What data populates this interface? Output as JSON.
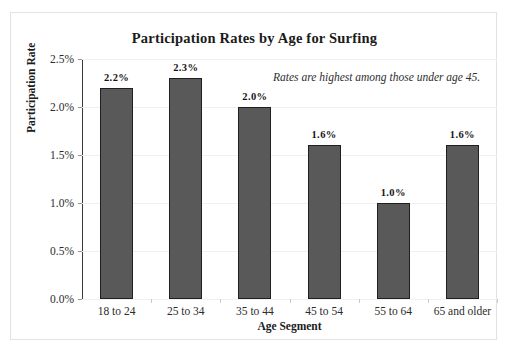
{
  "chart_data": {
    "type": "bar",
    "title": "Participation Rates by Age for Surfing",
    "xlabel": "Age Segment",
    "ylabel": "Participation Rate",
    "categories": [
      "18 to 24",
      "25 to 34",
      "35 to 44",
      "45 to 54",
      "55 to 64",
      "65 and older"
    ],
    "values": [
      2.2,
      2.3,
      2.0,
      1.6,
      1.0,
      1.6
    ],
    "data_labels": [
      "2.2%",
      "2.3%",
      "2.0%",
      "1.6%",
      "1.0%",
      "1.6%"
    ],
    "ylim": [
      0.0,
      2.5
    ],
    "ytick_values": [
      0.0,
      0.5,
      1.0,
      1.5,
      2.0,
      2.5
    ],
    "ytick_labels": [
      "0.0%",
      "0.5%",
      "1.0%",
      "1.5%",
      "2.0%",
      "2.5%"
    ],
    "grid": false,
    "legend": "none",
    "annotations": [
      "Rates are highest among those under age 45."
    ],
    "colors": {
      "bar_fill": "#595959",
      "bar_border": "#1f1f1f",
      "axis": "#3a3a3a",
      "frame": "#e2e2e2",
      "text": "#1b1b1b"
    }
  }
}
